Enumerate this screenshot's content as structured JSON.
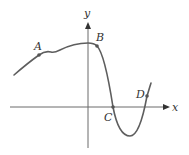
{
  "diagram": {
    "type": "function-graph",
    "axes": {
      "x_label": "x",
      "y_label": "y"
    },
    "points": [
      {
        "name": "A",
        "label": "A"
      },
      {
        "name": "B",
        "label": "B"
      },
      {
        "name": "C",
        "label": "C"
      },
      {
        "name": "D",
        "label": "D"
      }
    ],
    "colors": {
      "curve": "#5e5e5e",
      "axis": "#6b6b6b",
      "label": "#333333"
    }
  }
}
